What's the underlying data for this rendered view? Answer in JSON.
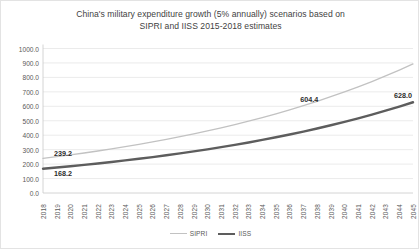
{
  "chart_data": {
    "type": "line",
    "title": "China's military expenditure growth (5% annually) scenarios based on SIPRI and IISS 2015-2018 estimates",
    "title_line1": "China's military expenditure growth (5% annually) scenarios based on",
    "title_line2": "SIPRI and IISS 2015-2018 estimates",
    "xlabel": "",
    "ylabel": "",
    "grid": true,
    "legend_position": "bottom",
    "ylim": [
      0,
      1000
    ],
    "y_ticks": [
      0,
      100,
      200,
      300,
      400,
      500,
      600,
      700,
      800,
      900,
      1000
    ],
    "y_tick_labels": [
      "0.0",
      "100.0",
      "200.0",
      "300.0",
      "400.0",
      "500.0",
      "600.0",
      "700.0",
      "800.0",
      "900.0",
      "1000.0"
    ],
    "x": [
      2018,
      2019,
      2020,
      2021,
      2022,
      2023,
      2024,
      2025,
      2026,
      2027,
      2028,
      2029,
      2030,
      2031,
      2032,
      2033,
      2034,
      2035,
      2036,
      2037,
      2038,
      2039,
      2040,
      2041,
      2042,
      2043,
      2044,
      2045
    ],
    "categories": [
      "2018",
      "2019",
      "2020",
      "2021",
      "2022",
      "2023",
      "2024",
      "2025",
      "2026",
      "2027",
      "2028",
      "2029",
      "2030",
      "2031",
      "2032",
      "2033",
      "2034",
      "2035",
      "2036",
      "2037",
      "2038",
      "2039",
      "2040",
      "2041",
      "2042",
      "2043",
      "2044",
      "2045"
    ],
    "series": [
      {
        "name": "SIPRI",
        "color": "#c2c2c2",
        "line_width": 1.3,
        "values": [
          239.2,
          251.2,
          263.7,
          276.9,
          290.7,
          305.3,
          320.5,
          336.6,
          353.4,
          371.1,
          389.6,
          409.1,
          429.6,
          451.0,
          473.6,
          497.3,
          522.1,
          548.2,
          575.6,
          604.4,
          634.6,
          666.4,
          699.7,
          734.7,
          771.4,
          810.0,
          850.5,
          893.0
        ]
      },
      {
        "name": "IISS",
        "color": "#5d5d5d",
        "line_width": 2.4,
        "values": [
          168.2,
          176.6,
          185.4,
          194.7,
          204.4,
          214.7,
          225.4,
          236.7,
          248.5,
          260.9,
          274.0,
          287.7,
          302.1,
          317.2,
          333.0,
          349.7,
          367.2,
          385.5,
          404.8,
          425.0,
          446.3,
          468.6,
          492.0,
          516.6,
          542.5,
          569.6,
          598.1,
          628.0
        ]
      }
    ],
    "annotations": [
      {
        "text": "239.2",
        "series": "SIPRI",
        "x": 2018,
        "y": 239.2
      },
      {
        "text": "168.2",
        "series": "IISS",
        "x": 2018,
        "y": 168.2
      },
      {
        "text": "604.4",
        "series": "SIPRI",
        "x": 2037,
        "y": 604.4
      },
      {
        "text": "628.0",
        "series": "IISS",
        "x": 2045,
        "y": 628.0
      }
    ]
  },
  "legend": {
    "items": [
      {
        "label": "SIPRI"
      },
      {
        "label": "IISS"
      }
    ]
  }
}
